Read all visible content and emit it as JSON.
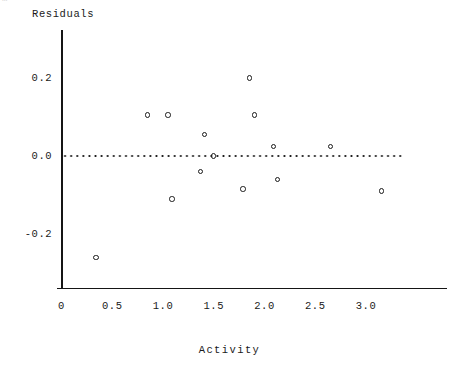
{
  "corner_fragment": "…",
  "chart_data": {
    "type": "scatter",
    "title": "",
    "xlabel": "Activity",
    "ylabel": "Residuals",
    "xlim": [
      0.0,
      3.35
    ],
    "ylim": [
      -0.32,
      0.27
    ],
    "grid": false,
    "legend": null,
    "xticks": [
      0,
      0.5,
      1.0,
      1.5,
      2.0,
      2.5,
      3.0
    ],
    "xtick_labels": [
      "0",
      "0.5",
      "1.0",
      "1.5",
      "2.0",
      "2.5",
      "3.0"
    ],
    "yticks": [
      0.2,
      0.0,
      -0.2
    ],
    "ytick_labels": [
      "0.2",
      "0.0",
      "-0.2"
    ],
    "reference_line": {
      "orientation": "horizontal",
      "value": 0.0,
      "style": "dotted",
      "color": "#1a1a1a"
    },
    "marker": {
      "shape": "circle-open",
      "color": "#1a1a1a",
      "size": 5
    },
    "x": [
      0.34,
      0.85,
      1.05,
      1.09,
      1.37,
      1.41,
      1.5,
      1.79,
      1.85,
      1.9,
      2.09,
      2.13,
      2.65,
      3.15
    ],
    "y": [
      -0.26,
      0.105,
      0.105,
      -0.11,
      -0.04,
      0.055,
      0.0,
      -0.085,
      0.2,
      0.105,
      0.025,
      -0.06,
      0.025,
      -0.09
    ],
    "points": [
      {
        "x": 0.34,
        "y": -0.26
      },
      {
        "x": 0.85,
        "y": 0.105
      },
      {
        "x": 1.05,
        "y": 0.105
      },
      {
        "x": 1.09,
        "y": -0.11
      },
      {
        "x": 1.37,
        "y": -0.04
      },
      {
        "x": 1.41,
        "y": 0.055
      },
      {
        "x": 1.5,
        "y": 0.0
      },
      {
        "x": 1.79,
        "y": -0.085
      },
      {
        "x": 1.85,
        "y": 0.2
      },
      {
        "x": 1.9,
        "y": 0.105
      },
      {
        "x": 2.09,
        "y": 0.025
      },
      {
        "x": 2.13,
        "y": -0.06
      },
      {
        "x": 2.65,
        "y": 0.025
      },
      {
        "x": 3.15,
        "y": -0.09
      }
    ]
  }
}
